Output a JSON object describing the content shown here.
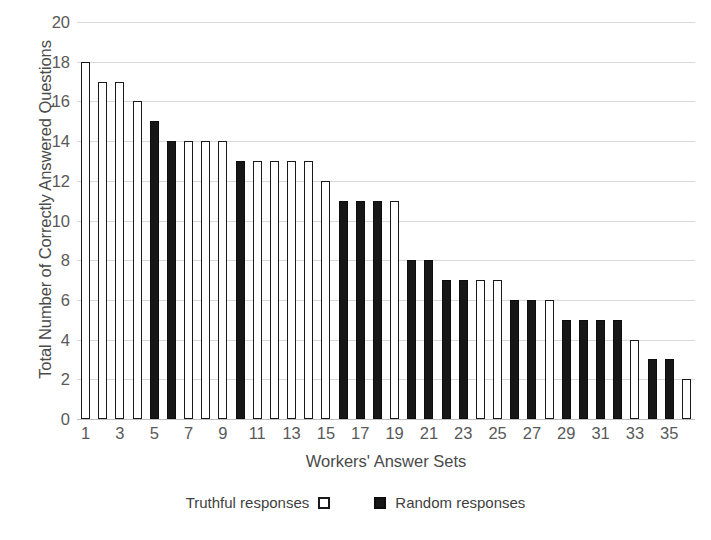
{
  "chart_data": {
    "type": "bar",
    "title": "",
    "xlabel": "Workers' Answer Sets",
    "ylabel": "Total Number of Correctly Answered Questions",
    "ylim": [
      0,
      20
    ],
    "ytick_step": 2,
    "yticks": [
      0,
      2,
      4,
      6,
      8,
      10,
      12,
      14,
      16,
      18,
      20
    ],
    "xticks": [
      1,
      3,
      5,
      7,
      9,
      11,
      13,
      15,
      17,
      19,
      21,
      23,
      25,
      27,
      29,
      31,
      33,
      35
    ],
    "grid": true,
    "legend_position": "bottom-center",
    "categories": [
      1,
      2,
      3,
      4,
      5,
      6,
      7,
      8,
      9,
      10,
      11,
      12,
      13,
      14,
      15,
      16,
      17,
      18,
      19,
      20,
      21,
      22,
      23,
      24,
      25,
      26,
      27,
      28,
      29,
      30,
      31,
      32,
      33,
      34,
      35,
      36
    ],
    "values": [
      18,
      17,
      17,
      16,
      15,
      14,
      14,
      14,
      14,
      13,
      13,
      13,
      13,
      13,
      12,
      11,
      11,
      11,
      11,
      8,
      8,
      7,
      7,
      7,
      7,
      6,
      6,
      6,
      5,
      5,
      5,
      5,
      4,
      3,
      3,
      2
    ],
    "bar_types": [
      "truthful",
      "truthful",
      "truthful",
      "truthful",
      "random",
      "random",
      "truthful",
      "truthful",
      "truthful",
      "random",
      "truthful",
      "truthful",
      "truthful",
      "truthful",
      "truthful",
      "random",
      "random",
      "random",
      "truthful",
      "random",
      "random",
      "random",
      "random",
      "truthful",
      "truthful",
      "random",
      "random",
      "truthful",
      "random",
      "random",
      "random",
      "random",
      "truthful",
      "random",
      "random",
      "truthful"
    ],
    "series": [
      {
        "name": "Truthful responses",
        "style": "white-fill-black-outline",
        "points": [
          {
            "x": 1,
            "y": 18
          },
          {
            "x": 2,
            "y": 17
          },
          {
            "x": 3,
            "y": 17
          },
          {
            "x": 4,
            "y": 16
          },
          {
            "x": 7,
            "y": 14
          },
          {
            "x": 8,
            "y": 14
          },
          {
            "x": 9,
            "y": 14
          },
          {
            "x": 11,
            "y": 13
          },
          {
            "x": 12,
            "y": 13
          },
          {
            "x": 13,
            "y": 13
          },
          {
            "x": 14,
            "y": 13
          },
          {
            "x": 15,
            "y": 12
          },
          {
            "x": 19,
            "y": 11
          },
          {
            "x": 24,
            "y": 7
          },
          {
            "x": 25,
            "y": 7
          },
          {
            "x": 28,
            "y": 6
          },
          {
            "x": 33,
            "y": 4
          },
          {
            "x": 36,
            "y": 2
          }
        ]
      },
      {
        "name": "Random responses",
        "style": "black-fill",
        "points": [
          {
            "x": 5,
            "y": 15
          },
          {
            "x": 6,
            "y": 14
          },
          {
            "x": 10,
            "y": 13
          },
          {
            "x": 16,
            "y": 11
          },
          {
            "x": 17,
            "y": 11
          },
          {
            "x": 18,
            "y": 11
          },
          {
            "x": 20,
            "y": 8
          },
          {
            "x": 21,
            "y": 8
          },
          {
            "x": 22,
            "y": 7
          },
          {
            "x": 23,
            "y": 7
          },
          {
            "x": 26,
            "y": 6
          },
          {
            "x": 27,
            "y": 6
          },
          {
            "x": 29,
            "y": 5
          },
          {
            "x": 30,
            "y": 5
          },
          {
            "x": 31,
            "y": 5
          },
          {
            "x": 32,
            "y": 5
          },
          {
            "x": 34,
            "y": 3
          },
          {
            "x": 35,
            "y": 3
          }
        ]
      }
    ]
  },
  "axes": {
    "y_title": "Total Number of Correctly Answered Questions",
    "x_title": "Workers' Answer Sets"
  },
  "legend": {
    "truthful_label": "Truthful responses",
    "random_label": "Random responses"
  },
  "colors": {
    "bar_outline": "#1a1a1a",
    "bar_truthful_fill": "#ffffff",
    "bar_random_fill": "#171717",
    "gridline": "#d9d9d9",
    "tick_text": "#595959",
    "title_text": "#4a4a4a",
    "background": "#ffffff"
  }
}
